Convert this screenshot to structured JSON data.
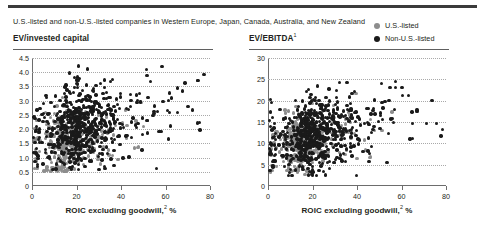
{
  "exhibit": {
    "subtitle": "U.S.-listed and non-U.S.-listed companies in Western Europe, Japan, Canada, Australia, and New Zealand"
  },
  "legend": {
    "position": "top-right",
    "items": [
      {
        "label": "U.S.-listed",
        "color": "#8d8d8d",
        "marker": "circle"
      },
      {
        "label": "Non-U.S.-listed",
        "color": "#1a1a1a",
        "marker": "circle"
      }
    ]
  },
  "colors": {
    "us_listed": "#8d8d8d",
    "non_us_listed": "#1a1a1a",
    "axis": "#6d6d6d",
    "grid": "#a9a9a9",
    "rule_dark": "#3b3b3b",
    "rule_light": "#5f5f5f",
    "text": "#231f20"
  },
  "chart_data": [
    {
      "type": "scatter",
      "title": "EV/invested capital",
      "title_superscript": "",
      "xlabel": "ROIC excluding goodwill,",
      "xlabel_superscript": "2",
      "xlabel_suffix": "%",
      "ylabel": "",
      "xlim": [
        0,
        80
      ],
      "ylim": [
        0,
        4.5
      ],
      "xticks": [
        0,
        20,
        40,
        60,
        80
      ],
      "xtick_labels": [
        "0",
        "20",
        "40",
        "60",
        "80"
      ],
      "yticks": [
        0,
        0.5,
        1.0,
        1.5,
        2.0,
        2.5,
        3.0,
        3.5,
        4.0,
        4.5
      ],
      "ytick_labels": [
        "0",
        "0.5",
        "1.0",
        "1.5",
        "2.0",
        "2.5",
        "3.0",
        "3.5",
        "4.0",
        "4.5"
      ],
      "grid": "horizontal-dotted",
      "legend_position": "external-top-right",
      "series": [
        {
          "name": "U.S.-listed",
          "color": "#8d8d8d",
          "marker_size": 3.4,
          "approx_count": 330,
          "cluster": {
            "x_mode": 16,
            "x_spread": 11,
            "x_min": 1,
            "x_max": 56,
            "y_mode": 1.55,
            "y_spread": 0.55,
            "y_min": 0.5,
            "y_max": 4.15
          }
        },
        {
          "name": "Non-U.S.-listed",
          "color": "#1a1a1a",
          "marker_size": 3.4,
          "approx_count": 620,
          "cluster": {
            "x_mode": 22,
            "x_spread": 17,
            "x_min": 0.5,
            "x_max": 79,
            "y_mode": 2.05,
            "y_spread": 0.75,
            "y_min": 0.55,
            "y_max": 4.25
          }
        }
      ]
    },
    {
      "type": "scatter",
      "title": "EV/EBITDA",
      "title_superscript": "1",
      "xlabel": "ROIC excluding goodwill,",
      "xlabel_superscript": "2",
      "xlabel_suffix": "%",
      "ylabel": "",
      "xlim": [
        0,
        80
      ],
      "ylim": [
        0,
        30
      ],
      "xticks": [
        0,
        20,
        40,
        60,
        80
      ],
      "xtick_labels": [
        "0",
        "20",
        "40",
        "60",
        "80"
      ],
      "yticks": [
        0,
        5,
        10,
        15,
        20,
        25,
        30
      ],
      "ytick_labels": [
        "0",
        "5",
        "10",
        "15",
        "20",
        "25",
        "30"
      ],
      "grid": "horizontal-dotted",
      "legend_position": "external-top-right",
      "series": [
        {
          "name": "U.S.-listed",
          "color": "#8d8d8d",
          "marker_size": 3.4,
          "approx_count": 330,
          "cluster": {
            "x_mode": 15,
            "x_spread": 11,
            "x_min": 1,
            "x_max": 58,
            "y_mode": 10.5,
            "y_spread": 3.4,
            "y_min": 2.5,
            "y_max": 22.5
          }
        },
        {
          "name": "Non-U.S.-listed",
          "color": "#1a1a1a",
          "marker_size": 3.4,
          "approx_count": 620,
          "cluster": {
            "x_mode": 20,
            "x_spread": 17,
            "x_min": 0.5,
            "x_max": 79,
            "y_mode": 12.5,
            "y_spread": 4.6,
            "y_min": 2.2,
            "y_max": 25.2
          }
        }
      ]
    }
  ]
}
